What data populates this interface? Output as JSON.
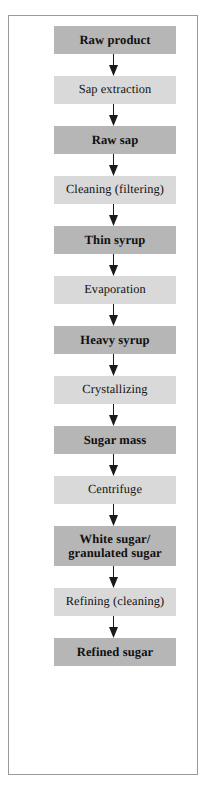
{
  "diagram": {
    "orientation": "vertical-top-to-bottom",
    "colors": {
      "product_box": "#b6b6b6",
      "process_box": "#d9d9d9",
      "frame_border": "#9a9a9a",
      "arrow": "#1a1a1a",
      "text": "#101010",
      "background": "#ffffff"
    },
    "legend_note": "Darker bold boxes are materials/products; lighter boxes are processing steps.",
    "nodes": [
      {
        "id": "raw-product",
        "label": "Raw product",
        "kind": "product",
        "lines": 1
      },
      {
        "id": "sap-extraction",
        "label": "Sap extraction",
        "kind": "process",
        "lines": 1
      },
      {
        "id": "raw-sap",
        "label": "Raw sap",
        "kind": "product",
        "lines": 1
      },
      {
        "id": "cleaning",
        "label": "Cleaning (filtering)",
        "kind": "process",
        "lines": 1
      },
      {
        "id": "thin-syrup",
        "label": "Thin syrup",
        "kind": "product",
        "lines": 1
      },
      {
        "id": "evaporation",
        "label": "Evaporation",
        "kind": "process",
        "lines": 1
      },
      {
        "id": "heavy-syrup",
        "label": "Heavy syrup",
        "kind": "product",
        "lines": 1
      },
      {
        "id": "crystallizing",
        "label": "Crystallizing",
        "kind": "process",
        "lines": 1
      },
      {
        "id": "sugar-mass",
        "label": "Sugar mass",
        "kind": "product",
        "lines": 1
      },
      {
        "id": "centrifuge",
        "label": "Centrifuge",
        "kind": "process",
        "lines": 1
      },
      {
        "id": "white-sugar",
        "label": "White sugar/\ngranulated sugar",
        "kind": "product",
        "lines": 2
      },
      {
        "id": "refining",
        "label": "Refining (cleaning)",
        "kind": "process",
        "lines": 1
      },
      {
        "id": "refined-sugar",
        "label": "Refined sugar",
        "kind": "product",
        "lines": 1
      }
    ],
    "edges": [
      {
        "from": "raw-product",
        "to": "sap-extraction",
        "marker": "arrowhead-down"
      },
      {
        "from": "sap-extraction",
        "to": "raw-sap",
        "marker": "arrowhead-down"
      },
      {
        "from": "raw-sap",
        "to": "cleaning",
        "marker": "arrowhead-down"
      },
      {
        "from": "cleaning",
        "to": "thin-syrup",
        "marker": "arrowhead-down"
      },
      {
        "from": "thin-syrup",
        "to": "evaporation",
        "marker": "arrowhead-down"
      },
      {
        "from": "evaporation",
        "to": "heavy-syrup",
        "marker": "arrowhead-down"
      },
      {
        "from": "heavy-syrup",
        "to": "crystallizing",
        "marker": "arrowhead-down"
      },
      {
        "from": "crystallizing",
        "to": "sugar-mass",
        "marker": "arrowhead-down"
      },
      {
        "from": "sugar-mass",
        "to": "centrifuge",
        "marker": "arrowhead-down"
      },
      {
        "from": "centrifuge",
        "to": "white-sugar",
        "marker": "arrowhead-down"
      },
      {
        "from": "white-sugar",
        "to": "refining",
        "marker": "arrowhead-down"
      },
      {
        "from": "refining",
        "to": "refined-sugar",
        "marker": "arrowhead-down"
      }
    ]
  }
}
